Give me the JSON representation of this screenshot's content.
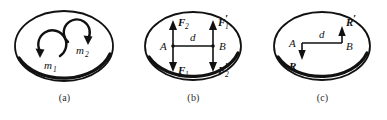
{
  "figure": {
    "type": "physics-diagram",
    "background_color": "#ffffff",
    "ink_color": "#111111",
    "panels": [
      {
        "id": "a",
        "caption": "(a)",
        "shape": "oval",
        "elements": [
          {
            "kind": "curved-arrow",
            "name": "moment-arrow-1",
            "label": "m",
            "subscript": "1",
            "direction": "counterclockwise"
          },
          {
            "kind": "curved-arrow",
            "name": "moment-arrow-2",
            "label": "m",
            "subscript": "2",
            "direction": "clockwise"
          }
        ]
      },
      {
        "id": "b",
        "caption": "(b)",
        "shape": "oval",
        "points": [
          {
            "name": "point-a",
            "label": "A"
          },
          {
            "name": "point-b",
            "label": "B"
          }
        ],
        "distance_label": "d",
        "elements": [
          {
            "kind": "vector",
            "name": "force-f2-up",
            "label": "F",
            "subscript": "2",
            "prime": "",
            "direction": "up",
            "at": "A"
          },
          {
            "kind": "vector",
            "name": "force-f1-down",
            "label": "F",
            "subscript": "1",
            "prime": "",
            "direction": "down",
            "at": "A"
          },
          {
            "kind": "vector",
            "name": "force-f1-prime-up",
            "label": "F",
            "subscript": "1",
            "prime": "′",
            "direction": "up",
            "at": "B"
          },
          {
            "kind": "vector",
            "name": "force-f2-prime-down",
            "label": "F",
            "subscript": "2",
            "prime": "′",
            "direction": "down",
            "at": "B"
          }
        ]
      },
      {
        "id": "c",
        "caption": "(c)",
        "shape": "oval",
        "points": [
          {
            "name": "point-a",
            "label": "A"
          },
          {
            "name": "point-b",
            "label": "B"
          }
        ],
        "distance_label": "d",
        "elements": [
          {
            "kind": "vector",
            "name": "resultant-r-down",
            "label": "R",
            "prime": "",
            "direction": "down",
            "at": "A"
          },
          {
            "kind": "vector",
            "name": "resultant-r-prime-up",
            "label": "R",
            "prime": "′",
            "direction": "up",
            "at": "B"
          }
        ]
      }
    ]
  },
  "labels": {
    "m1_base": "m",
    "m1_sub": "1",
    "m2_base": "m",
    "m2_sub": "2",
    "point_a": "A",
    "point_b": "B",
    "d": "d",
    "F": "F",
    "sub1": "1",
    "sub2": "2",
    "prime": "′",
    "R": "R",
    "caption_a": "(a)",
    "caption_b": "(b)",
    "caption_c": "(c)"
  }
}
